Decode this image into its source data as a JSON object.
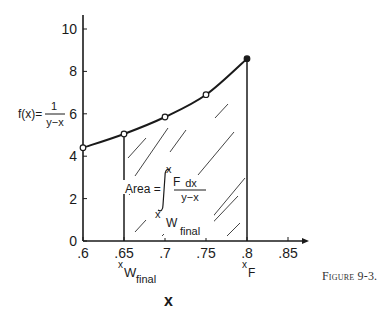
{
  "chart_data": {
    "type": "line",
    "title": "",
    "caption": "Figure 9-3.",
    "xlabel": "x",
    "ylabel": "f(x) = 1 / (y − x)",
    "ylabel_parts": {
      "lhs": "f(x)=",
      "num": "1",
      "den": "y−x"
    },
    "xlim": [
      0.6,
      0.87
    ],
    "ylim": [
      0,
      10.5
    ],
    "x_ticks": [
      ".6",
      ".65",
      ".7",
      ".75",
      ".8",
      ".85"
    ],
    "x_tick_values": [
      0.6,
      0.65,
      0.7,
      0.75,
      0.8,
      0.85
    ],
    "y_ticks": [
      "0",
      "2",
      "4",
      "6",
      "8",
      "10"
    ],
    "y_tick_values": [
      0,
      2,
      4,
      6,
      8,
      10
    ],
    "grid": false,
    "series": [
      {
        "name": "f(x) = 1/(y−x)",
        "x": [
          0.6,
          0.65,
          0.7,
          0.75,
          0.8
        ],
        "y": [
          4.4,
          5.05,
          5.85,
          6.9,
          8.6
        ],
        "marker": "open-circle"
      }
    ],
    "shaded_region": {
      "from_x": 0.65,
      "to_x": 0.8,
      "pattern": "diagonal-hatch",
      "label": "Area = ∫ from x_W,final to x_F of dx/(y−x)"
    },
    "annotations": [
      {
        "text": "x_W_final",
        "at_x": 0.65,
        "position": "below-axis",
        "main": "x",
        "sub": "W",
        "subsub": "final"
      },
      {
        "text": "x_F",
        "at_x": 0.8,
        "position": "below-axis",
        "main": "x",
        "sub": "F"
      }
    ],
    "integral_label": {
      "prefix": "Area =",
      "upper_main": "x",
      "upper_sub": "F",
      "integrand_num": "dx",
      "integrand_den": "y−x",
      "lower_main": "x",
      "lower_sub": "W",
      "lower_subsub": "final"
    }
  }
}
